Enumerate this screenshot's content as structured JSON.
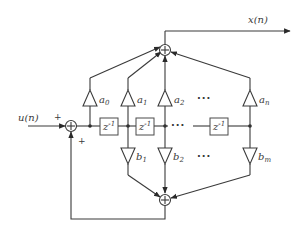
{
  "diagram": {
    "type": "signal-flow block diagram (IIR filter, direct form II)",
    "input_label": "u(n)",
    "output_label": "x(n)",
    "input_sum_signs": {
      "top": "+",
      "bottom": "+"
    },
    "delay_label": "z",
    "delay_exponent": "-1",
    "feedforward_gains": [
      {
        "base": "a",
        "sub": "0"
      },
      {
        "base": "a",
        "sub": "1"
      },
      {
        "base": "a",
        "sub": "2"
      },
      {
        "base": "a",
        "sub": "n"
      }
    ],
    "feedback_gains": [
      {
        "base": "b",
        "sub": "1"
      },
      {
        "base": "b",
        "sub": "2"
      },
      {
        "base": "b",
        "sub": "m"
      }
    ],
    "ellipsis": "···",
    "sum_symbol": "+",
    "colors": {
      "line": "#3a3a3a",
      "background": "#ffffff"
    }
  }
}
